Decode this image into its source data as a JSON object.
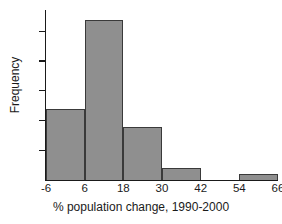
{
  "chart_data": {
    "type": "bar",
    "title": "",
    "subtitle": "",
    "xlabel": "% population change, 1990-2000",
    "ylabel": "Frequency",
    "bin_width": 12,
    "bin_edges": [
      -6,
      6,
      18,
      30,
      42,
      54,
      66
    ],
    "categories": [
      "-6 to 6",
      "6 to 18",
      "18 to 30",
      "30 to 42",
      "42 to 54",
      "54 to 66"
    ],
    "values": [
      12,
      27,
      9,
      2,
      0,
      1
    ],
    "xlim": [
      -6,
      66
    ],
    "ylim": [
      0,
      28.6
    ],
    "xticks": [
      -6,
      6,
      18,
      30,
      42,
      54,
      66
    ],
    "xtick_labels": [
      "-6",
      "6",
      "18",
      "30",
      "42",
      "54",
      "66"
    ],
    "yticks": [
      5,
      10,
      15,
      20,
      25
    ],
    "ytick_labels": [
      "5",
      "10",
      "15",
      "20",
      "25"
    ],
    "grid": false,
    "legend": null,
    "bar_fill_color": "#8f8f8f",
    "bar_edge_color": "#3a3a3a",
    "axis_color": "#1a1a1a",
    "background_color": "#ffffff"
  }
}
